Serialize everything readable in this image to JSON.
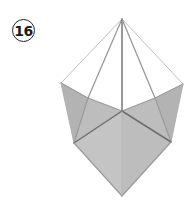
{
  "step": {
    "number": "16"
  },
  "diagram": {
    "colors": {
      "background": "#ffffff",
      "facet_fill": "#bdbdbd",
      "facet_fill_dark": "#b3b3b3",
      "facet_fill_light": "#c4c4c4",
      "crease_dark": "#6e6e6e",
      "crease_light": "#9a9a9a",
      "outline_thin": "#b0b0b0"
    }
  }
}
